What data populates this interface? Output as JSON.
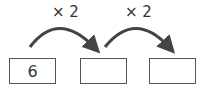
{
  "diagram": {
    "operations": [
      {
        "label": "× 2"
      },
      {
        "label": "× 2"
      }
    ],
    "boxes": [
      {
        "value": "6"
      },
      {
        "value": ""
      },
      {
        "value": ""
      }
    ],
    "colors": {
      "stroke": "#444444",
      "text": "#333333"
    }
  }
}
